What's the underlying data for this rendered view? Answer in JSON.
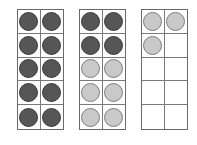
{
  "colors": {
    "dark": "#565656",
    "light": "#c9c9c9",
    "border": "#6a6a6a"
  },
  "frames": [
    {
      "left": 17,
      "cells": [
        "dark",
        "dark",
        "dark",
        "dark",
        "dark",
        "dark",
        "dark",
        "dark",
        "dark",
        "dark"
      ],
      "dark_count": 10,
      "light_count": 0
    },
    {
      "left": 79,
      "cells": [
        "dark",
        "dark",
        "dark",
        "dark",
        "light",
        "light",
        "light",
        "light",
        "light",
        "light"
      ],
      "dark_count": 4,
      "light_count": 6
    },
    {
      "left": 141,
      "cells": [
        "light",
        "light",
        "light",
        "empty",
        "empty",
        "empty",
        "empty",
        "empty",
        "empty",
        "empty"
      ],
      "dark_count": 0,
      "light_count": 3
    }
  ]
}
